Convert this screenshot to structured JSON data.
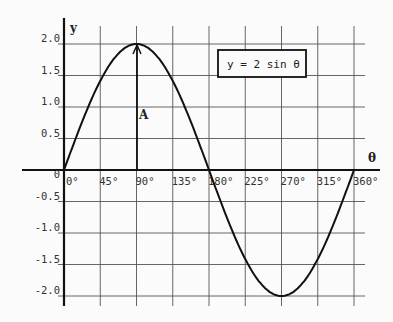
{
  "chart_data": {
    "type": "line",
    "title": "",
    "xlabel": "θ",
    "ylabel": "y",
    "legend": "y = 2 sin θ",
    "annotation": "A",
    "x": [
      0,
      45,
      90,
      135,
      180,
      225,
      270,
      315,
      360
    ],
    "x_tick_labels": [
      "0°",
      "45°",
      "90°",
      "135°",
      "180°",
      "225°",
      "270°",
      "315°",
      "360°"
    ],
    "y_tick_labels": [
      "2.0",
      "1.5",
      "1.0",
      "0.5",
      "0",
      "-0.5",
      "-1.0",
      "-1.5",
      "-2.0"
    ],
    "y_ticks": [
      2.0,
      1.5,
      1.0,
      0.5,
      0,
      -0.5,
      -1.0,
      -1.5,
      -2.0
    ],
    "series": [
      {
        "name": "y = 2 sin θ",
        "values": [
          0,
          1.414,
          2.0,
          1.414,
          0,
          -1.414,
          -2.0,
          -1.414,
          0
        ]
      }
    ],
    "xlim": [
      0,
      360
    ],
    "ylim": [
      -2.0,
      2.0
    ],
    "grid": true,
    "legend_position": "upper right (boxed)"
  },
  "labels": {
    "x_axis": "θ",
    "y_axis": "y",
    "equation": "y = 2 sin θ",
    "amplitude": "A"
  }
}
